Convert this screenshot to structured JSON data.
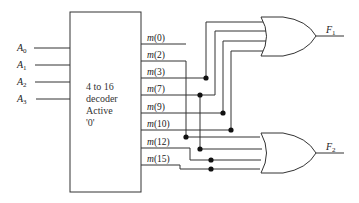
{
  "decoder": {
    "label_lines": [
      "4 to 16",
      "decoder",
      "Active",
      "'0'"
    ],
    "inputs": [
      {
        "name": "A",
        "sub": "0"
      },
      {
        "name": "A",
        "sub": "1"
      },
      {
        "name": "A",
        "sub": "2"
      },
      {
        "name": "A",
        "sub": "3"
      }
    ],
    "outputs": [
      {
        "fn": "m",
        "arg": "(0)"
      },
      {
        "fn": "m",
        "arg": "(2)"
      },
      {
        "fn": "m",
        "arg": "(3)"
      },
      {
        "fn": "m",
        "arg": "(7)"
      },
      {
        "fn": "m",
        "arg": "(9)"
      },
      {
        "fn": "m",
        "arg": "(10)"
      },
      {
        "fn": "m",
        "arg": "(12)"
      },
      {
        "fn": "m",
        "arg": "(15)"
      }
    ]
  },
  "gates": [
    {
      "type": "OR",
      "output": {
        "name": "F",
        "sub": "1"
      },
      "inputs": [
        "m(3)",
        "m(7)",
        "m(9)",
        "m(10)"
      ]
    },
    {
      "type": "OR",
      "output": {
        "name": "F",
        "sub": "2"
      },
      "inputs": [
        "m(2)",
        "m(7)",
        "m(12)",
        "m(15)"
      ]
    }
  ]
}
